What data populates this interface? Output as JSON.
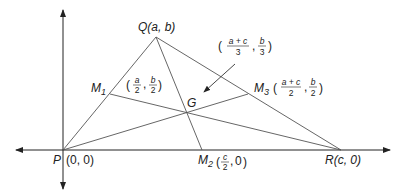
{
  "diagram": {
    "points": {
      "P": {
        "name": "P",
        "coords": "(0, 0)",
        "x": 63,
        "y": 150
      },
      "Q": {
        "name": "Q",
        "coords": "(a, b)",
        "label": "Q(a, b)",
        "x": 156,
        "y": 37
      },
      "R": {
        "name": "R",
        "coords": "(c, 0)",
        "label": "R(c, 0)",
        "x": 341,
        "y": 150
      },
      "M1": {
        "name": "M",
        "sub": "1",
        "frac_x_num": "a",
        "frac_x_den": "2",
        "frac_y_num": "b",
        "frac_y_den": "2",
        "x": 110,
        "y": 94
      },
      "M2": {
        "name": "M",
        "sub": "2",
        "frac_x_num": "c",
        "frac_x_den": "2",
        "y_val": "0",
        "x": 202,
        "y": 150
      },
      "M3": {
        "name": "M",
        "sub": "3",
        "frac_x_num": "a + c",
        "frac_x_den": "2",
        "frac_y_num": "b",
        "frac_y_den": "2",
        "x": 248,
        "y": 94
      },
      "G": {
        "name": "G",
        "frac_x_num": "a + c",
        "frac_x_den": "3",
        "frac_y_num": "b",
        "frac_y_den": "3",
        "x": 187,
        "y": 112
      }
    },
    "colors": {
      "line": "#555555",
      "axis": "#222222",
      "text": "#222222"
    }
  }
}
